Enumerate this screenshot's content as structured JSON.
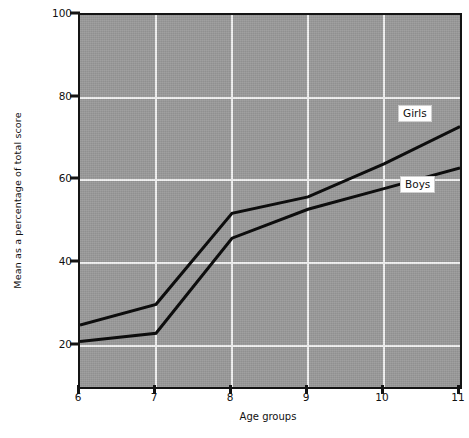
{
  "chart_data": {
    "type": "line",
    "title": "",
    "xlabel": "Age groups",
    "ylabel": "Mean as a percentage of total score",
    "x": [
      6,
      7,
      8,
      9,
      10,
      11
    ],
    "xtick_labels": [
      "6",
      "7",
      "8",
      "9",
      "10",
      "11"
    ],
    "ytick_labels": [
      "20",
      "40",
      "60",
      "80",
      "100"
    ],
    "yticks": [
      20,
      40,
      60,
      80,
      100
    ],
    "xlim": [
      6,
      11
    ],
    "ylim": [
      10,
      100
    ],
    "grid": true,
    "legend_position": "inline-callout",
    "series": [
      {
        "name": "Girls",
        "values": [
          25,
          30,
          52,
          56,
          64,
          73
        ]
      },
      {
        "name": "Boys",
        "values": [
          21,
          23,
          46,
          53,
          58,
          63
        ]
      }
    ],
    "plot_background_color": "#9a9a9a",
    "gridline_color": "#f2f2f2",
    "line_color": "#0d0d0d",
    "frame_color": "#141414"
  }
}
